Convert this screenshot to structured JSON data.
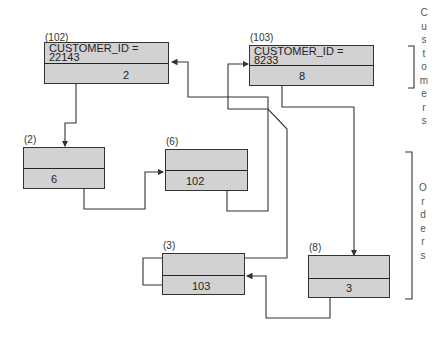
{
  "records": {
    "r102": {
      "addr": "(102)",
      "key_line1": "CUSTOMER_ID =",
      "key_line2": "22143",
      "pointer": "2"
    },
    "r103": {
      "addr": "(103)",
      "key_line1": "CUSTOMER_ID =",
      "key_line2": "8233",
      "pointer": "8"
    },
    "r2": {
      "addr": "(2)",
      "pointer": "6"
    },
    "r6": {
      "addr": "(6)",
      "pointer": "102"
    },
    "r3": {
      "addr": "(3)",
      "pointer": "103"
    },
    "r8": {
      "addr": "(8)",
      "pointer": "3"
    }
  },
  "groups": {
    "customers": "Customers",
    "orders": "Orders"
  },
  "colors": {
    "record_fill": "#d2d2d2",
    "line": "#333333"
  }
}
